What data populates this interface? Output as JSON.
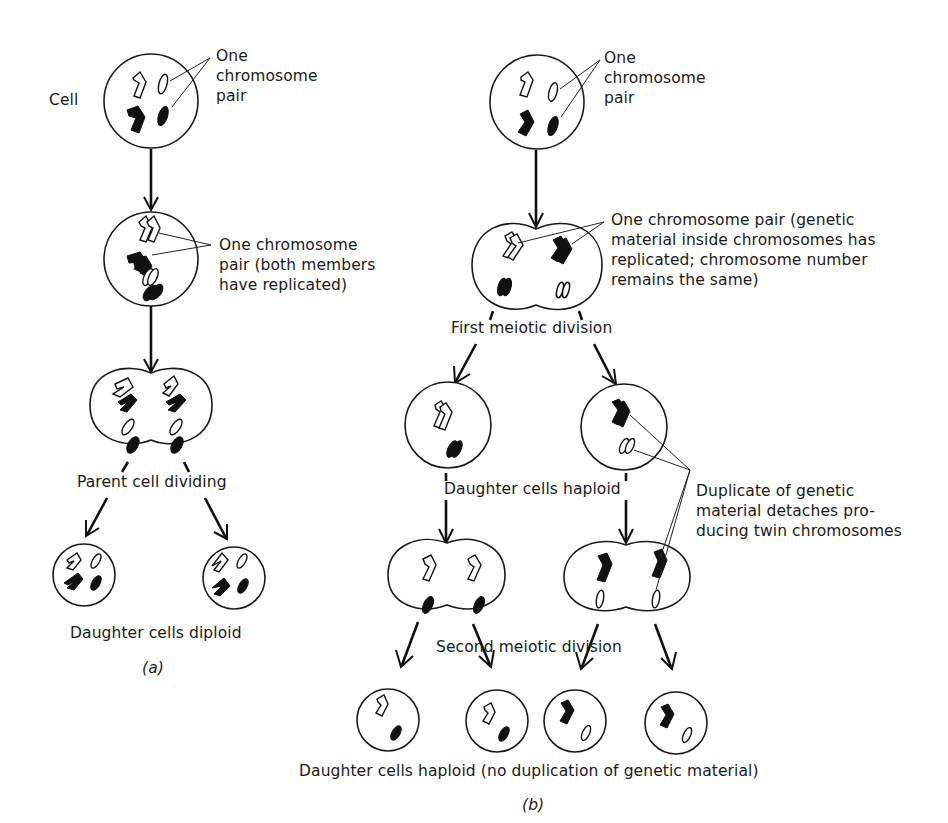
{
  "figure": {
    "panel_a": {
      "caption": "(a)",
      "labels": {
        "cell": "Cell",
        "pair_top": "One\nchromosome\npair",
        "pair_replicated": "One chromosome\npair (both members\nhave replicated)",
        "parent_dividing": "Parent cell dividing",
        "daughter_diploid": "Daughter cells diploid"
      }
    },
    "panel_b": {
      "caption": "(b)",
      "labels": {
        "pair_top": "One\nchromosome\npair",
        "pair_replicated": "One chromosome pair (genetic\nmaterial inside chromosomes has\nreplicated; chromosome number\nremains the same)",
        "first_division": "First meiotic division",
        "daughter_haploid": "Daughter cells haploid",
        "duplicate_detaches": "Duplicate of genetic\nmaterial detaches pro-\nducing twin chromosomes",
        "second_division": "Second meiotic division",
        "final_haploid": "Daughter cells haploid (no duplication of genetic material)"
      }
    },
    "colors": {
      "ink": "#1a1a1a",
      "background": "#ffffff"
    }
  }
}
